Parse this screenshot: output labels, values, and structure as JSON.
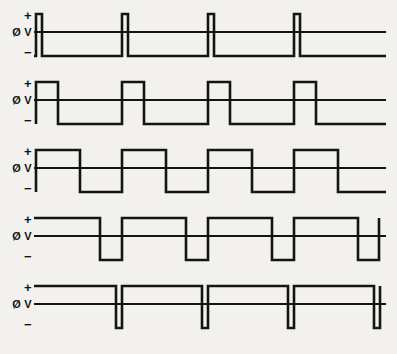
{
  "figure": {
    "title": "",
    "background_color": "#f2f1ee",
    "line_color": "#141414",
    "row_count": 5,
    "axis_labels": {
      "positive": "+",
      "zero": "Ø V",
      "negative": "−"
    }
  },
  "chart_data": {
    "type": "line",
    "title": "",
    "subtitle": "",
    "xlabel": "",
    "ylabel": "",
    "grid": false,
    "legend_position": "none",
    "x_range": [
      0,
      363
    ],
    "y_levels": {
      "positive": 14,
      "zero": 32,
      "negative": 56
    },
    "period_px": 86,
    "series": [
      {
        "name": "Waveform 1 — narrow positive pulses",
        "row": 1,
        "duty_cycle_percent": 8,
        "start_level": "negative",
        "points": [
          [
            0,
            56
          ],
          [
            2,
            56
          ],
          [
            2,
            14
          ],
          [
            8,
            14
          ],
          [
            8,
            56
          ],
          [
            88,
            56
          ],
          [
            88,
            14
          ],
          [
            94,
            14
          ],
          [
            94,
            56
          ],
          [
            174,
            56
          ],
          [
            174,
            14
          ],
          [
            180,
            14
          ],
          [
            180,
            56
          ],
          [
            260,
            56
          ],
          [
            260,
            14
          ],
          [
            266,
            14
          ],
          [
            266,
            56
          ],
          [
            352,
            56
          ]
        ],
        "zero_line": [
          [
            0,
            32
          ],
          [
            352,
            32
          ]
        ]
      },
      {
        "name": "Waveform 2 — 25 percent duty cycle",
        "row": 2,
        "duty_cycle_percent": 25,
        "start_level": "positive",
        "points": [
          [
            2,
            56
          ],
          [
            2,
            14
          ],
          [
            24,
            14
          ],
          [
            24,
            56
          ],
          [
            88,
            56
          ],
          [
            88,
            14
          ],
          [
            110,
            14
          ],
          [
            110,
            56
          ],
          [
            174,
            56
          ],
          [
            174,
            14
          ],
          [
            196,
            14
          ],
          [
            196,
            56
          ],
          [
            260,
            56
          ],
          [
            260,
            14
          ],
          [
            282,
            14
          ],
          [
            282,
            56
          ],
          [
            352,
            56
          ]
        ],
        "zero_line": [
          [
            0,
            32
          ],
          [
            352,
            32
          ]
        ]
      },
      {
        "name": "Waveform 3 — 50 percent duty cycle square wave",
        "row": 3,
        "duty_cycle_percent": 50,
        "start_level": "positive",
        "points": [
          [
            2,
            56
          ],
          [
            2,
            14
          ],
          [
            46,
            14
          ],
          [
            46,
            56
          ],
          [
            88,
            56
          ],
          [
            88,
            14
          ],
          [
            132,
            14
          ],
          [
            132,
            56
          ],
          [
            174,
            56
          ],
          [
            174,
            14
          ],
          [
            218,
            14
          ],
          [
            218,
            56
          ],
          [
            260,
            56
          ],
          [
            260,
            14
          ],
          [
            304,
            14
          ],
          [
            304,
            56
          ],
          [
            352,
            56
          ]
        ],
        "zero_line": [
          [
            0,
            32
          ],
          [
            352,
            32
          ]
        ]
      },
      {
        "name": "Waveform 4 — 75 percent duty cycle",
        "row": 4,
        "duty_cycle_percent": 75,
        "start_level": "positive",
        "points": [
          [
            0,
            14
          ],
          [
            66,
            14
          ],
          [
            66,
            56
          ],
          [
            88,
            56
          ],
          [
            88,
            14
          ],
          [
            152,
            14
          ],
          [
            152,
            56
          ],
          [
            174,
            56
          ],
          [
            174,
            14
          ],
          [
            238,
            14
          ],
          [
            238,
            56
          ],
          [
            260,
            56
          ],
          [
            260,
            14
          ],
          [
            324,
            14
          ],
          [
            324,
            56
          ],
          [
            345,
            56
          ],
          [
            345,
            14
          ]
        ],
        "zero_line": [
          [
            0,
            32
          ],
          [
            352,
            32
          ]
        ]
      },
      {
        "name": "Waveform 5 — narrow negative pulses",
        "row": 5,
        "duty_cycle_percent": 92,
        "start_level": "positive",
        "points": [
          [
            0,
            14
          ],
          [
            82,
            14
          ],
          [
            82,
            56
          ],
          [
            88,
            56
          ],
          [
            88,
            14
          ],
          [
            168,
            14
          ],
          [
            168,
            56
          ],
          [
            174,
            56
          ],
          [
            174,
            14
          ],
          [
            254,
            14
          ],
          [
            254,
            56
          ],
          [
            260,
            56
          ],
          [
            260,
            14
          ],
          [
            340,
            14
          ],
          [
            340,
            56
          ],
          [
            346,
            56
          ],
          [
            346,
            14
          ]
        ],
        "zero_line": [
          [
            0,
            32
          ],
          [
            352,
            32
          ]
        ]
      }
    ]
  }
}
